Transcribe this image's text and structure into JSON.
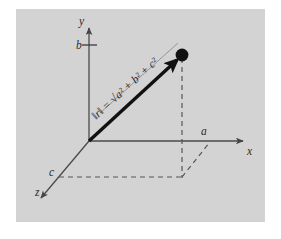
{
  "figure": {
    "background_color": "#ffffff",
    "panel_color": "#d3d3d3",
    "ink_color": "#333333",
    "axis_color": "#555555",
    "vector_color": "#111111",
    "dash_color": "#555555",
    "labels": {
      "y_axis": "y",
      "x_axis": "x",
      "z_axis": "z",
      "component_a": "a",
      "component_b": "b",
      "component_c": "c",
      "magnitude_formula": "‖r‖ = √a² + b² + c²",
      "magnitude_norm": "‖r‖",
      "magnitude_equals": "=",
      "magnitude_radical": "√",
      "magnitude_terms": "a² + b² + c²"
    },
    "geometry": {
      "origin": {
        "x": 89,
        "y": 141
      },
      "point_terminal": {
        "x": 182,
        "y": 55
      },
      "x_axis_tip": {
        "x": 246,
        "y": 141
      },
      "y_axis_tip": {
        "x": 89,
        "y": 25
      },
      "z_axis_tip": {
        "x": 38,
        "y": 201
      },
      "b_tick": {
        "x": 89,
        "y": 45
      },
      "a_mark": {
        "x": 210,
        "y": 141
      },
      "c_mark": {
        "x": 58,
        "y": 177
      },
      "projection_corner": {
        "x": 182,
        "y": 177
      }
    },
    "elements": [
      {
        "name": "y-axis",
        "type": "arrow"
      },
      {
        "name": "x-axis",
        "type": "arrow"
      },
      {
        "name": "z-axis",
        "type": "arrow"
      },
      {
        "name": "vector-r",
        "type": "thick-arrow"
      },
      {
        "name": "terminal-point",
        "type": "filled-circle"
      },
      {
        "name": "b-tick-mark",
        "type": "tick"
      },
      {
        "name": "vertical-projection",
        "type": "dashed-line"
      },
      {
        "name": "z-projection",
        "type": "dashed-line"
      },
      {
        "name": "x-projection",
        "type": "dashed-line"
      }
    ]
  }
}
